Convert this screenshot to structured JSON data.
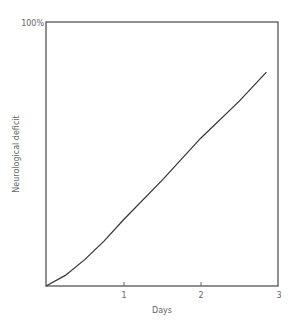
{
  "chart_data": {
    "type": "line",
    "title": "",
    "xlabel": "Days",
    "ylabel": "Neurological deficit",
    "y_top_label": "100%",
    "x_ticks": [
      "1",
      "2",
      "3"
    ],
    "xlim": [
      0,
      3
    ],
    "ylim": [
      0,
      100
    ],
    "grid": false,
    "legend": null,
    "series": [
      {
        "name": "Neurological deficit",
        "x": [
          0,
          0.25,
          0.5,
          0.75,
          1.0,
          1.5,
          2.0,
          2.5,
          2.85
        ],
        "y": [
          0,
          4,
          10,
          17,
          25,
          40,
          56,
          70,
          81
        ]
      }
    ]
  },
  "caption_partial": "Fig. 3.?"
}
